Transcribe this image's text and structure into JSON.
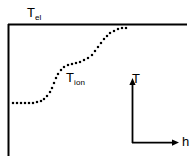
{
  "figure": {
    "kind": "schematic-plot",
    "background_color": "#ffffff",
    "ink_color": "#000000",
    "width": 194,
    "height": 158
  },
  "labels": {
    "electron_temperature": {
      "base": "T",
      "sub": "el"
    },
    "ion_temperature": {
      "base": "T",
      "sub": "ion"
    },
    "axis_vertical": "T",
    "axis_horizontal": "h"
  },
  "chart_data": {
    "type": "line",
    "title": "",
    "xlabel": "h",
    "ylabel": "T",
    "grid": false,
    "legend": "inline-annotations",
    "axis_style": "open-frame: left vertical rule and top horizontal rule only",
    "annotations": [
      {
        "text": "T_el",
        "target": "top-horizontal-line",
        "x": 27,
        "y": 4
      },
      {
        "text": "T_ion",
        "target": "dotted-staircase-curve",
        "x": 66,
        "y": 69
      }
    ],
    "inset_axes": {
      "origin": [
        132,
        143
      ],
      "vertical_label": "T",
      "vertical_tip": [
        132,
        79
      ],
      "horizontal_label": "h",
      "horizontal_tip": [
        178,
        143
      ],
      "arrow_heads": true
    },
    "series": [
      {
        "name": "T_el",
        "style": "solid",
        "description": "constant electron temperature, horizontal upper bound",
        "x": [
          8,
          186
        ],
        "y": [
          24,
          24
        ]
      },
      {
        "name": "T_ion",
        "style": "dotted",
        "description": "ion temperature rising in two plateaued steps toward T_el",
        "points": [
          [
            13,
            103
          ],
          [
            17,
            103
          ],
          [
            21,
            103
          ],
          [
            25,
            103
          ],
          [
            29,
            103
          ],
          [
            33,
            103
          ],
          [
            37,
            102
          ],
          [
            41,
            101
          ],
          [
            44,
            99
          ],
          [
            47,
            96
          ],
          [
            50,
            92
          ],
          [
            52,
            88
          ],
          [
            54,
            83
          ],
          [
            56,
            78
          ],
          [
            58,
            74
          ],
          [
            61,
            70
          ],
          [
            64,
            67
          ],
          [
            68,
            65
          ],
          [
            72,
            64
          ],
          [
            76,
            63
          ],
          [
            80,
            62
          ],
          [
            84,
            60
          ],
          [
            88,
            58
          ],
          [
            92,
            55
          ],
          [
            95,
            51
          ],
          [
            98,
            47
          ],
          [
            101,
            43
          ],
          [
            104,
            39
          ],
          [
            107,
            36
          ],
          [
            110,
            33
          ],
          [
            114,
            31
          ],
          [
            118,
            29
          ],
          [
            122,
            28
          ],
          [
            126,
            28
          ]
        ]
      }
    ],
    "xlim": [
      8,
      186
    ],
    "ylim": [
      24,
      155
    ]
  },
  "frame": {
    "left_rule": {
      "x": 8,
      "y1": 24,
      "y2": 155
    },
    "top_rule": {
      "y": 24,
      "x1": 8,
      "x2": 186
    }
  }
}
